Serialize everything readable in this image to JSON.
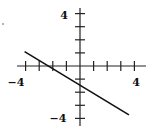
{
  "chart_data": {
    "type": "line",
    "title": "",
    "xlabel": "",
    "ylabel": "",
    "xlim": [
      -4,
      4
    ],
    "ylim": [
      -4,
      4
    ],
    "grid": false,
    "x_tick_labels": [
      "-4",
      "4"
    ],
    "y_tick_labels": [
      "4",
      "-4"
    ],
    "tick_step": 1,
    "series": [
      {
        "name": "line",
        "points": [
          [
            -4,
            1.33
          ],
          [
            -2,
            0
          ],
          [
            0,
            -1.33
          ],
          [
            3.6,
            -3.73
          ]
        ],
        "equation": "y = -(2/3)x - 4/3"
      }
    ],
    "colors": {
      "axis": "#222222",
      "line": "#111111",
      "background": "#ffffff"
    }
  },
  "labels": {
    "x_min": "−4",
    "x_max": "4",
    "y_max": "4",
    "y_min": "−4"
  }
}
